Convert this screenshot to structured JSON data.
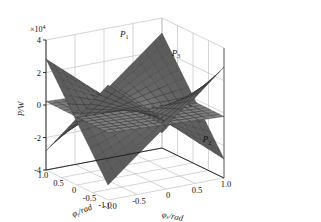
{
  "figure": {
    "type": "3d-surface-plot",
    "background": "#ffffff",
    "pane_color": "#ffffff",
    "grid_color": "#b9b9b9",
    "axis_color": "#1a1a1a"
  },
  "chart_data": {
    "type": "line",
    "plot_kind": "3d-surface",
    "title": "",
    "xlabel": "φₓ/rad",
    "ylabel": "φᵧ/rad",
    "zlabel": "P/W",
    "z_exponent_label": "×10⁴",
    "z_exponent_base": "×10",
    "z_exponent_power": "4",
    "xlim": [
      -1.0,
      1.0
    ],
    "ylim": [
      -1.0,
      1.0
    ],
    "zlim": [
      -4,
      4
    ],
    "z_scale": 10000,
    "grid": true,
    "legend": "none",
    "xticks": [
      "-1.0",
      "-0.5",
      "0",
      "0.5",
      "1.0"
    ],
    "xtick_values": [
      -1.0,
      -0.5,
      0,
      0.5,
      1.0
    ],
    "yticks": [
      "1.0",
      "0.5",
      "0",
      "-0.5",
      "-1.0"
    ],
    "ytick_values": [
      1.0,
      0.5,
      0,
      -0.5,
      -1.0
    ],
    "zticks": [
      "4",
      "2",
      "0",
      "-2",
      "-4"
    ],
    "ztick_values": [
      4,
      2,
      0,
      -2,
      -4
    ],
    "series": [
      {
        "name": "P1",
        "label": "P₁",
        "label_text": "P",
        "label_sub": "1",
        "description": "upper saddle surface, high at back-left and front-right corners",
        "corner_values": {
          "x-1_y-1": 2.9,
          "x-1_y1": -3.4,
          "x1_y-1": -3.4,
          "x1_y1": 2.9
        },
        "color": "#4a4a4a"
      },
      {
        "name": "P2",
        "label": "P₂",
        "label_text": "P",
        "label_sub": "2",
        "description": "lower saddle surface, mirrored, low at back-left and front-right",
        "corner_values": {
          "x-1_y-1": -3.4,
          "x-1_y1": 2.9,
          "x1_y-1": 2.9,
          "x1_y1": -3.4
        },
        "color": "#3a3a3a"
      },
      {
        "name": "P3",
        "label": "P₃",
        "label_text": "P",
        "label_sub": "3",
        "description": "near-flat mid plane slightly tilted, centred on z=0",
        "corner_values": {
          "x-1_y-1": 0.2,
          "x-1_y1": 0.2,
          "x1_y-1": -0.2,
          "x1_y1": -0.2
        },
        "color": "#6e6e6e"
      }
    ],
    "annotations": [
      {
        "text": "P",
        "sub": "1",
        "x": 0.35,
        "y": 1.0,
        "z": 3.3
      },
      {
        "text": "P",
        "sub": "3",
        "x": 1.0,
        "y": 0.55,
        "z": 2.1
      },
      {
        "text": "P",
        "sub": "2",
        "x": 1.0,
        "y": -0.45,
        "z": -2.3
      }
    ]
  }
}
